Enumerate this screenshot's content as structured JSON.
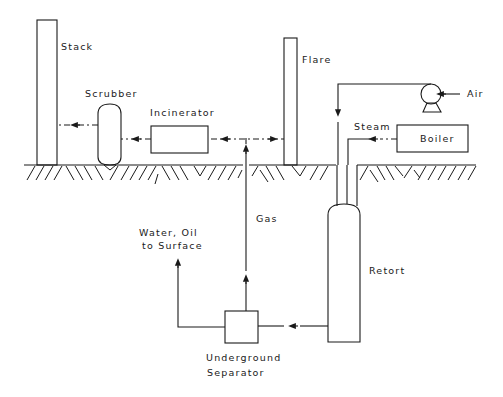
{
  "diagram": {
    "title": "",
    "labels": {
      "stack": "Stack",
      "scrubber": "Scrubber",
      "incinerator": "Incinerator",
      "flare": "Flare",
      "air": "Air",
      "steam": "Steam",
      "boiler": "Boiler",
      "gas": "Gas",
      "water_oil_line1": "Water, Oil",
      "water_oil_line2": "to Surface",
      "retort": "Retort",
      "separator_line1": "Underground",
      "separator_line2": "Separator"
    },
    "nodes": [
      {
        "id": "stack",
        "label": "Stack",
        "type": "tall-column",
        "location": "surface"
      },
      {
        "id": "scrubber",
        "label": "Scrubber",
        "type": "vessel",
        "location": "surface"
      },
      {
        "id": "incinerator",
        "label": "Incinerator",
        "type": "box",
        "location": "surface"
      },
      {
        "id": "flare",
        "label": "Flare",
        "type": "tall-column",
        "location": "surface"
      },
      {
        "id": "air-compressor",
        "label": "Air",
        "type": "pump",
        "location": "surface"
      },
      {
        "id": "boiler",
        "label": "Boiler",
        "type": "box",
        "location": "surface"
      },
      {
        "id": "retort",
        "label": "Retort",
        "type": "vessel",
        "location": "underground"
      },
      {
        "id": "separator",
        "label": "Underground Separator",
        "type": "box",
        "location": "underground"
      }
    ],
    "edges": [
      {
        "from": "air-compressor",
        "to": "retort",
        "style": "solid",
        "label": ""
      },
      {
        "from": "boiler",
        "to": "retort",
        "style": "dash-dot",
        "label": "Steam"
      },
      {
        "from": "retort",
        "to": "separator",
        "style": "solid",
        "label": ""
      },
      {
        "from": "separator",
        "to": "surface",
        "style": "solid",
        "label": "Water, Oil to Surface"
      },
      {
        "from": "separator",
        "to": "gas-junction",
        "style": "solid",
        "label": "Gas"
      },
      {
        "from": "gas-junction",
        "to": "flare",
        "style": "dash-dot",
        "label": ""
      },
      {
        "from": "gas-junction",
        "to": "incinerator",
        "style": "dash-dot",
        "label": ""
      },
      {
        "from": "incinerator",
        "to": "scrubber",
        "style": "dash-dot",
        "label": ""
      },
      {
        "from": "scrubber",
        "to": "stack",
        "style": "dash-dot",
        "label": ""
      }
    ],
    "colors": {
      "line": "#1a1a1a",
      "background": "#ffffff"
    }
  }
}
